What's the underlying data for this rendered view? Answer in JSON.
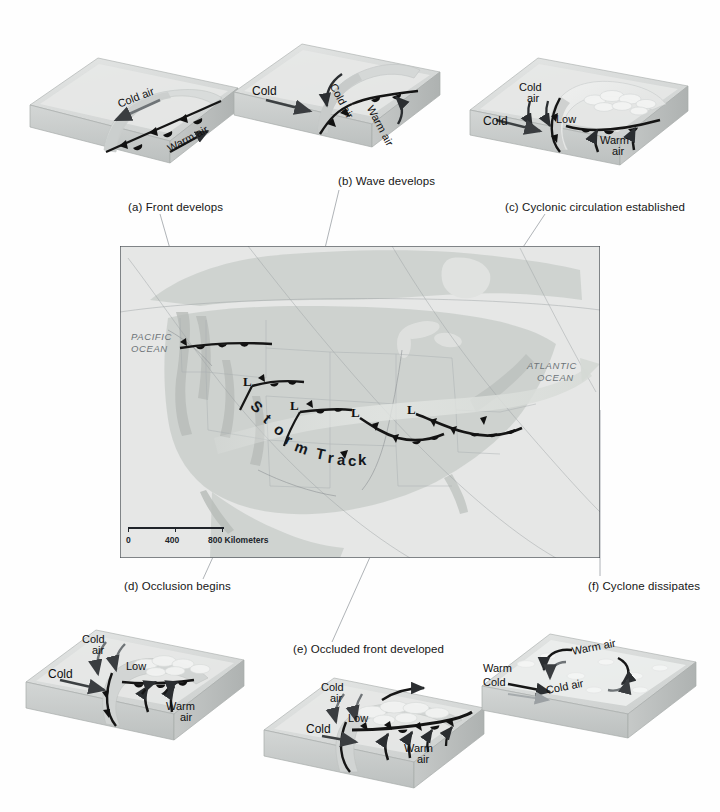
{
  "figure": {
    "background": "#fefefe"
  },
  "panels": [
    {
      "id": "a",
      "caption": "(a) Front develops",
      "caption_x": 128,
      "caption_y": 208,
      "labels": [
        {
          "text": "Cold air",
          "x": 126,
          "y": 104,
          "rot": -28
        },
        {
          "text": "Warm air",
          "x": 182,
          "y": 140,
          "rot": -30
        }
      ]
    },
    {
      "id": "b",
      "caption": "(b) Wave develops",
      "caption_x": 338,
      "caption_y": 182,
      "labels": [
        {
          "text": "Cold",
          "x": 255,
          "y": 92,
          "rot": 0
        },
        {
          "text": "Cold air",
          "x": 338,
          "y": 82,
          "rot": -62
        },
        {
          "text": "Warm air",
          "x": 372,
          "y": 105,
          "rot": -62
        }
      ]
    },
    {
      "id": "c",
      "caption": "(c) Cyclonic circulation established",
      "caption_x": 520,
      "caption_y": 208,
      "labels": [
        {
          "text": "Cold",
          "x": 524,
          "y": 88,
          "rot": 0
        },
        {
          "text": "air",
          "x": 531,
          "y": 99,
          "rot": 0
        },
        {
          "text": "Cold",
          "x": 487,
          "y": 120,
          "rot": 0
        },
        {
          "text": "Low",
          "x": 561,
          "y": 120,
          "rot": 0
        },
        {
          "text": "Warm",
          "x": 607,
          "y": 140,
          "rot": 0
        },
        {
          "text": "air",
          "x": 617,
          "y": 151,
          "rot": 0
        }
      ]
    },
    {
      "id": "d",
      "caption": "(d) Occlusion begins",
      "caption_x": 124,
      "caption_y": 587,
      "labels": [
        {
          "text": "Cold",
          "x": 88,
          "y": 639,
          "rot": 0
        },
        {
          "text": "air",
          "x": 96,
          "y": 650,
          "rot": 0
        },
        {
          "text": "Cold",
          "x": 52,
          "y": 673,
          "rot": 0
        },
        {
          "text": "Low",
          "x": 132,
          "y": 666,
          "rot": 0
        },
        {
          "text": "Warm",
          "x": 174,
          "y": 706,
          "rot": 0
        },
        {
          "text": "air",
          "x": 186,
          "y": 717,
          "rot": 0
        }
      ]
    },
    {
      "id": "e",
      "caption": "(e) Occluded front developed",
      "caption_x": 293,
      "caption_y": 650,
      "labels": [
        {
          "text": "Cold",
          "x": 327,
          "y": 687,
          "rot": 0
        },
        {
          "text": "air",
          "x": 334,
          "y": 698,
          "rot": 0
        },
        {
          "text": "Cold",
          "x": 310,
          "y": 728,
          "rot": 0
        },
        {
          "text": "Low",
          "x": 354,
          "y": 718,
          "rot": 0
        },
        {
          "text": "Warm",
          "x": 412,
          "y": 748,
          "rot": 0
        },
        {
          "text": "air",
          "x": 423,
          "y": 759,
          "rot": 0
        }
      ]
    },
    {
      "id": "f",
      "caption": "(f) Cyclone dissipates",
      "caption_x": 588,
      "caption_y": 587,
      "labels": [
        {
          "text": "Warm air",
          "x": 578,
          "y": 651,
          "rot": -12
        },
        {
          "text": "Warm",
          "x": 489,
          "y": 668,
          "rot": 0
        },
        {
          "text": "Cold",
          "x": 489,
          "y": 682,
          "rot": 0
        },
        {
          "text": "Cold air",
          "x": 552,
          "y": 690,
          "rot": -12
        }
      ]
    }
  ],
  "map": {
    "frame": {
      "x": 120,
      "y": 246,
      "w": 480,
      "h": 312
    },
    "ocean_labels": [
      {
        "text": "PACIFIC",
        "x": 131,
        "y": 337
      },
      {
        "text": "OCEAN",
        "x": 131,
        "y": 349
      },
      {
        "text": "ATLANTIC",
        "x": 531,
        "y": 366
      },
      {
        "text": "OCEAN",
        "x": 537,
        "y": 378
      }
    ],
    "storm_track_label": "Storm Track",
    "storm_track_letters": [
      {
        "ch": "S",
        "x": 252,
        "y": 405,
        "rot": 42
      },
      {
        "ch": "t",
        "x": 264,
        "y": 416,
        "rot": 40
      },
      {
        "ch": "o",
        "x": 274,
        "y": 426,
        "rot": 35
      },
      {
        "ch": "r",
        "x": 285,
        "y": 435,
        "rot": 30
      },
      {
        "ch": "m",
        "x": 295,
        "y": 443,
        "rot": 24
      },
      {
        "ch": "T",
        "x": 315,
        "y": 450,
        "rot": 14
      },
      {
        "ch": "r",
        "x": 328,
        "y": 454,
        "rot": 8
      },
      {
        "ch": "a",
        "x": 337,
        "y": 456,
        "rot": 4
      },
      {
        "ch": "c",
        "x": 348,
        "y": 457,
        "rot": 0
      },
      {
        "ch": "k",
        "x": 358,
        "y": 457,
        "rot": 0
      }
    ],
    "low_marks": [
      {
        "label": "L",
        "x": 247,
        "y": 382
      },
      {
        "label": "L",
        "x": 294,
        "y": 406
      },
      {
        "label": "L",
        "x": 355,
        "y": 413
      },
      {
        "label": "L",
        "x": 411,
        "y": 410
      }
    ],
    "scale": {
      "ticks": [
        "0",
        "400",
        "800 Kilometers"
      ],
      "x": 128,
      "y": 531,
      "w": 96
    }
  },
  "leaders": [
    {
      "name": "leader-a",
      "x1": 160,
      "y1": 216,
      "x2": 205,
      "y2": 372
    },
    {
      "name": "leader-b",
      "x1": 339,
      "y1": 190,
      "x2": 288,
      "y2": 400
    },
    {
      "name": "leader-c",
      "x1": 545,
      "y1": 216,
      "x2": 420,
      "y2": 400
    },
    {
      "name": "leader-d",
      "x1": 200,
      "y1": 580,
      "x2": 262,
      "y2": 446
    },
    {
      "name": "leader-e",
      "x1": 330,
      "y1": 643,
      "x2": 415,
      "y2": 450
    },
    {
      "name": "leader-f",
      "x1": 600,
      "y1": 578,
      "x2": 600,
      "y2": 408
    }
  ],
  "colors": {
    "block_top": "#dcdedd",
    "block_face": "#c9cccb",
    "block_side": "#b9bdbc",
    "warm_sector": "#e3e5e4",
    "front_line": "#151515",
    "arrow": "#2b2e31",
    "map_land": "#cfd2cf",
    "map_ocean": "#e6e7e6",
    "map_border": "#4a4f55",
    "leader": "#9aa0a4",
    "track_arrow": "#d8dbd8",
    "label_text": "#101010",
    "ocean_label": "#6d7478"
  }
}
